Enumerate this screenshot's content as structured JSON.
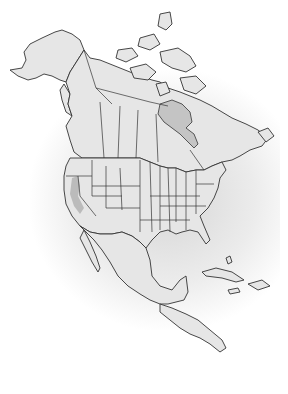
{
  "map": {
    "title": "",
    "region": "North America",
    "style": "grayscale outline",
    "colors": {
      "background": "#ffffff",
      "land": "#e6e6e6",
      "outline": "#333333",
      "water_body": "#c4c4c4",
      "range_highlight": "#b3b3b3"
    },
    "highlighted_range": {
      "label": "",
      "approximate_area": "northern California / southern Oregon"
    }
  }
}
